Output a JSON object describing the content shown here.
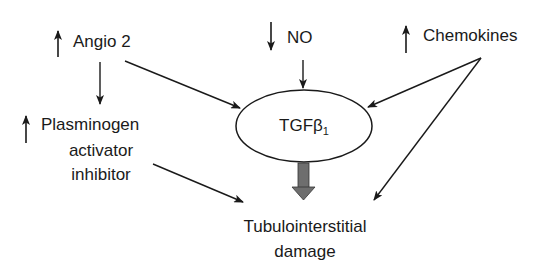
{
  "diagram": {
    "nodes": {
      "angio2": {
        "label": "Angio 2",
        "trend": "up"
      },
      "no": {
        "label": "NO",
        "trend": "down"
      },
      "chemokines": {
        "label": "Chemokines",
        "trend": "up"
      },
      "pai": {
        "line1": "Plasminogen",
        "line2": "activator",
        "line3": "inhibitor",
        "trend": "up"
      },
      "tgf": {
        "label": "TGFβ",
        "subscript": "1"
      },
      "damage": {
        "line1": "Tubulointerstitial",
        "line2": "damage"
      }
    },
    "edges": [
      {
        "from": "Angio 2",
        "to": "Plasminogen activator inhibitor"
      },
      {
        "from": "Angio 2",
        "to": "TGFβ1"
      },
      {
        "from": "NO",
        "to": "TGFβ1"
      },
      {
        "from": "Chemokines",
        "to": "TGFβ1"
      },
      {
        "from": "Chemokines",
        "to": "Tubulointerstitial damage"
      },
      {
        "from": "Plasminogen activator inhibitor",
        "to": "Tubulointerstitial damage"
      },
      {
        "from": "TGFβ1",
        "to": "Tubulointerstitial damage",
        "style": "thick-gray"
      }
    ],
    "colors": {
      "line": "#1a1a1a",
      "thick_arrow": "#6e6e6e"
    }
  }
}
